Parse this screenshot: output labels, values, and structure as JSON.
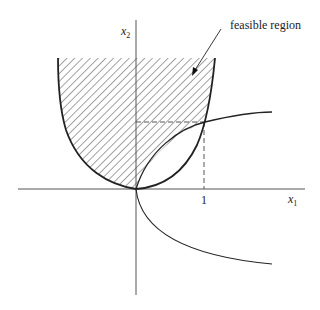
{
  "figure": {
    "type": "feasible-region-diagram",
    "annotation": "feasible region",
    "axes": {
      "x_label": "x",
      "x_label_sub": "1",
      "y_label": "x",
      "y_label_sub": "2",
      "x_tick_label": "1"
    },
    "curves": [
      {
        "name": "parabola",
        "description": "upward-opening parabola x2 = x1^2, bounding the feasible region"
      },
      {
        "name": "sideways-parabola",
        "description": "sideways parabola x1 = x2^2 opening to the right"
      }
    ],
    "reference_lines": [
      {
        "name": "x1-equals-1",
        "style": "dashed",
        "value": 1
      },
      {
        "name": "x2-at-intersection",
        "style": "dashed",
        "value": 1
      }
    ],
    "intersection_point": {
      "x1": 1,
      "x2": 1
    },
    "colors": {
      "stroke": "#222222",
      "axis": "#555555",
      "background": "#ffffff"
    }
  }
}
